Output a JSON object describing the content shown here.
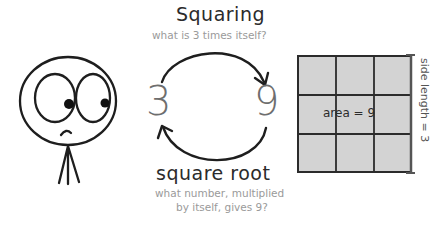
{
  "top_operation": {
    "title": "Squaring",
    "question": "what is 3 times itself?"
  },
  "bottom_operation": {
    "title": "square root",
    "question_line1": "what number, multiplied",
    "question_line2": "by itself, gives 9?"
  },
  "numbers": {
    "left": "3",
    "right": "9"
  },
  "grid": {
    "rows": 3,
    "cols": 3,
    "fill_color": "#d3d3d3",
    "line_color": "#2b2b2b",
    "area_label": "area = 9",
    "side_label": "side length = 3"
  },
  "character": {
    "description": "stick figure with large eyes looking right"
  }
}
